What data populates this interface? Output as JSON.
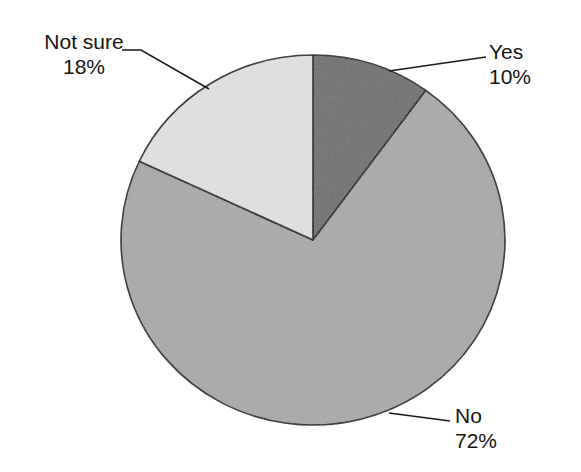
{
  "chart_data": {
    "type": "pie",
    "title": "",
    "subtitle": "",
    "xlabel": "",
    "ylabel": "",
    "grid": false,
    "legend_position": "none",
    "label_format": "name + percent",
    "total_percent": 100,
    "start_angle_deg": 0,
    "direction": "clockwise",
    "slices": [
      {
        "name": "Yes",
        "percent": 10,
        "percent_label": "10%",
        "color": "#6e6e6e",
        "start_angle_deg": 0,
        "end_angle_deg": 36,
        "leader_line": true
      },
      {
        "name": "No",
        "percent": 72,
        "percent_label": "72%",
        "color": "#a9a9a9",
        "start_angle_deg": 36,
        "end_angle_deg": 295.2,
        "leader_line": true
      },
      {
        "name": "Not sure",
        "percent": 18,
        "percent_label": "18%",
        "color": "#e2e2e2",
        "start_angle_deg": 295.2,
        "end_angle_deg": 360,
        "leader_line": true
      }
    ],
    "categories": [
      "Yes",
      "No",
      "Not sure"
    ],
    "values": [
      10,
      72,
      18
    ],
    "colors": [
      "#6e6e6e",
      "#a9a9a9",
      "#e2e2e2"
    ],
    "outline_color": "#1a1a1a",
    "background_color": "#ffffff"
  },
  "labels": {
    "notsure": {
      "name": "Not sure",
      "percent": "18%"
    },
    "yes": {
      "name": "Yes",
      "percent": "10%"
    },
    "no": {
      "name": "No",
      "percent": "72%"
    }
  },
  "geometry": {
    "center_x": 313,
    "center_y": 240,
    "radius_x": 192,
    "radius_y": 185
  }
}
